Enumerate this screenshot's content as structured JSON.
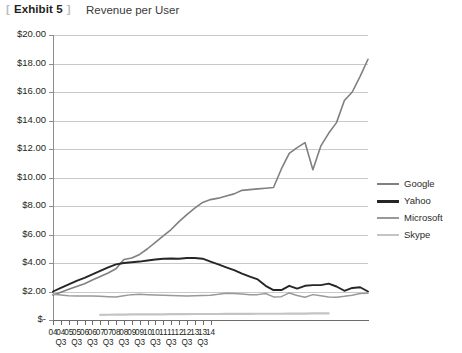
{
  "header": {
    "bracket_open": "[",
    "exhibit_label": "Exhibit 5",
    "bracket_close": "]",
    "title": "Revenue per User"
  },
  "legend": {
    "position": "right",
    "items": [
      {
        "label": "Google",
        "color": "#808080"
      },
      {
        "label": "Yahoo",
        "color": "#262626"
      },
      {
        "label": "Microsoft",
        "color": "#999999"
      },
      {
        "label": "Skype",
        "color": "#c4c4c4"
      }
    ]
  },
  "chart_data": {
    "type": "line",
    "title": "Revenue per User",
    "xlabel": "",
    "ylabel": "",
    "ylim": [
      0,
      20
    ],
    "ytick_values": [
      0,
      2,
      4,
      6,
      8,
      10,
      12,
      14,
      16,
      18,
      20
    ],
    "ytick_labels": [
      "$-",
      "$2.00",
      "$4.00",
      "$6.00",
      "$8.00",
      "$10.00",
      "$12.00",
      "$14.00",
      "$16.00",
      "$18.00",
      "$20.00"
    ],
    "grid": true,
    "legend_position": "right",
    "x_tick_labels": [
      {
        "year": "04",
        "quarter": ""
      },
      {
        "year": "04",
        "quarter": "Q3"
      },
      {
        "year": "05",
        "quarter": ""
      },
      {
        "year": "05",
        "quarter": "Q3"
      },
      {
        "year": "06",
        "quarter": ""
      },
      {
        "year": "06",
        "quarter": "Q3"
      },
      {
        "year": "07",
        "quarter": ""
      },
      {
        "year": "07",
        "quarter": "Q3"
      },
      {
        "year": "08",
        "quarter": ""
      },
      {
        "year": "08",
        "quarter": "Q3"
      },
      {
        "year": "09",
        "quarter": ""
      },
      {
        "year": "09",
        "quarter": "Q3"
      },
      {
        "year": "10",
        "quarter": ""
      },
      {
        "year": "10",
        "quarter": "Q3"
      },
      {
        "year": "11",
        "quarter": ""
      },
      {
        "year": "11",
        "quarter": "Q3"
      },
      {
        "year": "12",
        "quarter": ""
      },
      {
        "year": "12",
        "quarter": "Q3"
      },
      {
        "year": "13",
        "quarter": ""
      },
      {
        "year": "13",
        "quarter": "Q3"
      },
      {
        "year": "14",
        "quarter": ""
      }
    ],
    "x": [
      0,
      1,
      2,
      3,
      4,
      5,
      6,
      7,
      8,
      9,
      10,
      11,
      12,
      13,
      14,
      15,
      16,
      17,
      18,
      19,
      20,
      21,
      22,
      23,
      24,
      25,
      26,
      27,
      28,
      29,
      30,
      31,
      32,
      33,
      34,
      35,
      36,
      37,
      38,
      39,
      40
    ],
    "series": [
      {
        "name": "Google",
        "color": "#808080",
        "values": [
          1.75,
          1.95,
          2.15,
          2.35,
          2.55,
          2.8,
          3.05,
          3.3,
          3.6,
          4.25,
          4.35,
          4.6,
          5.0,
          5.45,
          5.9,
          6.35,
          6.9,
          7.4,
          7.85,
          8.25,
          8.45,
          8.55,
          8.7,
          8.85,
          9.1,
          9.15,
          9.2,
          9.25,
          9.3,
          10.6,
          11.7,
          12.1,
          12.45,
          10.55,
          12.2,
          13.1,
          13.85,
          15.4,
          16.0,
          17.1,
          18.3
        ]
      },
      {
        "name": "Yahoo",
        "color": "#262626",
        "values": [
          2.0,
          2.25,
          2.5,
          2.75,
          2.95,
          3.2,
          3.45,
          3.7,
          3.9,
          4.0,
          4.05,
          4.1,
          4.18,
          4.25,
          4.3,
          4.32,
          4.3,
          4.35,
          4.35,
          4.3,
          4.1,
          3.9,
          3.7,
          3.5,
          3.25,
          3.05,
          2.85,
          2.4,
          2.1,
          2.1,
          2.4,
          2.2,
          2.4,
          2.45,
          2.45,
          2.55,
          2.35,
          2.05,
          2.25,
          2.3,
          2.0
        ]
      },
      {
        "name": "Microsoft",
        "color": "#999999",
        "values": [
          1.8,
          1.75,
          1.7,
          1.68,
          1.68,
          1.68,
          1.66,
          1.64,
          1.62,
          1.7,
          1.78,
          1.8,
          1.78,
          1.76,
          1.74,
          1.72,
          1.7,
          1.68,
          1.7,
          1.72,
          1.74,
          1.8,
          1.88,
          1.86,
          1.82,
          1.78,
          1.78,
          1.86,
          1.62,
          1.64,
          1.9,
          1.72,
          1.6,
          1.78,
          1.7,
          1.62,
          1.6,
          1.66,
          1.74,
          1.86,
          1.88
        ]
      },
      {
        "name": "Skype",
        "color": "#c4c4c4",
        "values": [
          null,
          null,
          null,
          null,
          null,
          null,
          0.36,
          0.37,
          0.38,
          0.38,
          0.39,
          0.39,
          0.4,
          0.4,
          0.4,
          0.41,
          0.41,
          0.41,
          0.42,
          0.42,
          0.42,
          0.42,
          0.43,
          0.43,
          0.43,
          0.43,
          0.44,
          0.44,
          0.44,
          0.44,
          0.45,
          0.45,
          0.45,
          0.46,
          0.46,
          0.46,
          null,
          null,
          null,
          null,
          null
        ]
      }
    ]
  }
}
